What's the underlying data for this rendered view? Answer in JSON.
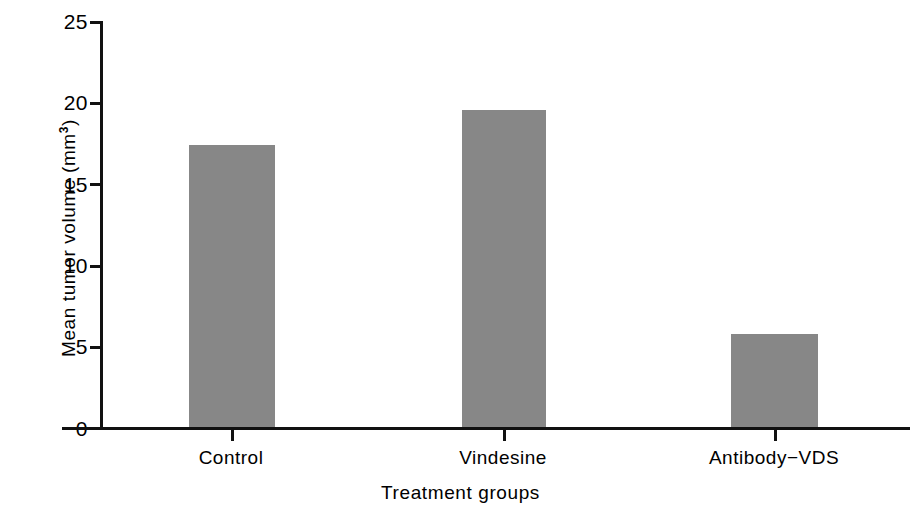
{
  "chart_data": {
    "type": "bar",
    "title": "",
    "xlabel": "Treatment groups",
    "ylabel": "Mean tumor volume (mm",
    "ylabel_superscript": "3",
    "ylabel_suffix": ")",
    "categories": [
      "Control",
      "Vindesine",
      "Antibody−VDS"
    ],
    "values": [
      17.4,
      19.6,
      5.8
    ],
    "ylim": [
      0,
      25
    ],
    "ytick_labels": [
      "0",
      "5",
      "10",
      "15",
      "20",
      "25"
    ],
    "ytick_values": [
      0,
      5,
      10,
      15,
      20,
      25
    ],
    "grid": false,
    "legend": false,
    "bar_color": "#878787",
    "axis_color": "#111111",
    "background_color": "#ffffff"
  },
  "axes": {
    "y": {
      "label_text": "Mean tumor volume (mm",
      "label_sup": "3",
      "label_tail": ")",
      "ticks": [
        {
          "value": 25,
          "label": "25"
        },
        {
          "value": 20,
          "label": "20"
        },
        {
          "value": 15,
          "label": "15"
        },
        {
          "value": 10,
          "label": "10"
        },
        {
          "value": 5,
          "label": "5"
        },
        {
          "value": 0,
          "label": "0"
        }
      ]
    },
    "x": {
      "title": "Treatment groups",
      "categories": [
        {
          "label": "Control"
        },
        {
          "label": "Vindesine"
        },
        {
          "label": "Antibody−VDS"
        }
      ]
    }
  }
}
